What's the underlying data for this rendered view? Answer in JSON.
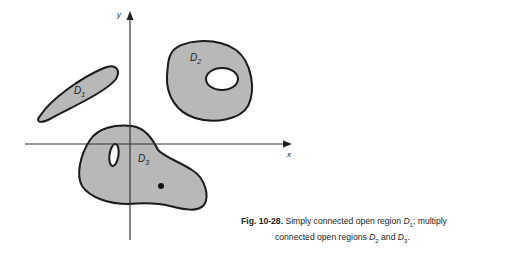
{
  "figure": {
    "axes": {
      "x_label": "x",
      "y_label": "y"
    },
    "regions": [
      {
        "name": "D",
        "sub": "1",
        "description": "simply connected open region"
      },
      {
        "name": "D",
        "sub": "2",
        "description": "multiply connected open region with one hole"
      },
      {
        "name": "D",
        "sub": "3",
        "description": "multiply connected open region with an oval hole and a point removed"
      }
    ],
    "colors": {
      "fill": "#b8b8b8",
      "stroke": "#1a1a1a",
      "hole": "#ffffff"
    }
  },
  "caption": {
    "number": "Fig. 10-28.",
    "line1_text": "Simply connected open region ",
    "line1_region": "D",
    "line1_sub": "1",
    "line1_suffix": "; multiply",
    "line2_text": "connected open regions ",
    "line2_region_a": "D",
    "line2_sub_a": "2",
    "line2_and": " and ",
    "line2_region_b": "D",
    "line2_sub_b": "3",
    "line2_end": "."
  }
}
